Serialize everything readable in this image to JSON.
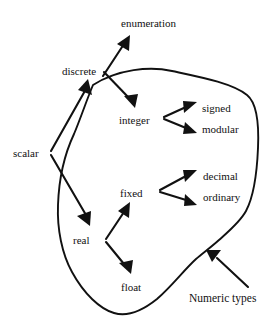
{
  "figure": {
    "kind": "node-and-arrow taxonomy diagram with enclosing region outline",
    "background_color": "#ffffff",
    "ink_color": "#111111"
  },
  "nodes": {
    "enumeration": {
      "label": "enumeration",
      "x": 121,
      "y": 17
    },
    "discrete": {
      "label": "discrete",
      "x": 62,
      "y": 65
    },
    "integer": {
      "label": "integer",
      "x": 119,
      "y": 114
    },
    "signed": {
      "label": "signed",
      "x": 202,
      "y": 102
    },
    "modular": {
      "label": "modular",
      "x": 202,
      "y": 123
    },
    "scalar": {
      "label": "scalar",
      "x": 13,
      "y": 147
    },
    "decimal": {
      "label": "decimal",
      "x": 203,
      "y": 170
    },
    "ordinary": {
      "label": "ordinary",
      "x": 203,
      "y": 191
    },
    "fixed": {
      "label": "fixed",
      "x": 120,
      "y": 187
    },
    "real": {
      "label": "real",
      "x": 73,
      "y": 234
    },
    "float": {
      "label": "float",
      "x": 121,
      "y": 281
    },
    "numeric_types": {
      "label": "Numeric types",
      "x": 189,
      "y": 292
    }
  },
  "edges": [
    {
      "from": "scalar",
      "to": "discrete",
      "style": "arrow"
    },
    {
      "from": "scalar",
      "to": "real",
      "style": "arrow"
    },
    {
      "from": "discrete",
      "to": "enumeration",
      "style": "arrow"
    },
    {
      "from": "discrete",
      "to": "integer",
      "style": "arrow"
    },
    {
      "from": "integer",
      "to": "signed",
      "style": "arrow"
    },
    {
      "from": "integer",
      "to": "modular",
      "style": "arrow"
    },
    {
      "from": "real",
      "to": "fixed",
      "style": "arrow"
    },
    {
      "from": "real",
      "to": "float",
      "style": "arrow"
    },
    {
      "from": "fixed",
      "to": "decimal",
      "style": "arrow"
    },
    {
      "from": "fixed",
      "to": "ordinary",
      "style": "arrow"
    },
    {
      "from": "numeric_types",
      "to": "region_outline",
      "style": "callout-arrow"
    }
  ],
  "region": {
    "name": "Numeric types region",
    "annotation_label": "Numeric types",
    "encloses": [
      "integer",
      "signed",
      "modular",
      "fixed",
      "decimal",
      "ordinary",
      "float",
      "real"
    ]
  }
}
